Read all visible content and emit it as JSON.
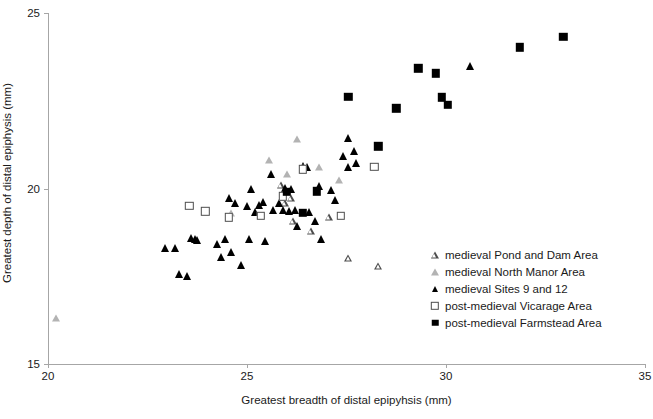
{
  "chart_data": {
    "type": "scatter",
    "title": "",
    "xlabel": "Greatest breadth of distal epipyhsis (mm)",
    "ylabel": "Greatest depth of distal epiphysis (mm)",
    "xlim": [
      20,
      35
    ],
    "ylim": [
      15,
      25
    ],
    "xticks": [
      20,
      25,
      30,
      35
    ],
    "yticks": [
      15,
      20,
      25
    ],
    "xtick_labels": [
      "20",
      "25",
      "30",
      "35"
    ],
    "ytick_labels": [
      "15",
      "20",
      "25"
    ],
    "grid": false,
    "legend_position": "center-right",
    "series": [
      {
        "name": "medieval Pond and Dam Area",
        "marker": "triangle-open",
        "color": "#4d4d4d",
        "points": [
          [
            25.85,
            20.1
          ],
          [
            25.95,
            19.78
          ],
          [
            26.1,
            20.14
          ],
          [
            26.15,
            19.68
          ],
          [
            26.6,
            19.6
          ],
          [
            27.05,
            20.18
          ],
          [
            27.55,
            19.22
          ],
          [
            28.3,
            19.18
          ]
        ]
      },
      {
        "name": "medieval North Manor Area",
        "marker": "triangle-grey",
        "color": "#b3b3b3",
        "points": [
          [
            20.2,
            16.32
          ],
          [
            24.6,
            19.3
          ],
          [
            25.55,
            20.8
          ],
          [
            26.0,
            20.42
          ],
          [
            26.25,
            21.42
          ],
          [
            26.8,
            20.6
          ],
          [
            27.3,
            20.25
          ]
        ]
      },
      {
        "name": "medieval Sites 9 and 12",
        "marker": "triangle-black",
        "color": "#000000",
        "points": [
          [
            22.95,
            18.3
          ],
          [
            23.2,
            18.3
          ],
          [
            23.3,
            17.55
          ],
          [
            23.5,
            17.52
          ],
          [
            23.6,
            18.6
          ],
          [
            23.7,
            18.55
          ],
          [
            23.75,
            18.52
          ],
          [
            24.25,
            18.42
          ],
          [
            24.35,
            18.05
          ],
          [
            24.45,
            18.55
          ],
          [
            24.55,
            19.72
          ],
          [
            24.6,
            18.2
          ],
          [
            24.7,
            19.58
          ],
          [
            24.85,
            17.82
          ],
          [
            25.0,
            19.5
          ],
          [
            25.05,
            18.55
          ],
          [
            25.1,
            19.98
          ],
          [
            25.2,
            19.32
          ],
          [
            25.3,
            19.52
          ],
          [
            25.4,
            19.62
          ],
          [
            25.45,
            18.5
          ],
          [
            25.6,
            20.42
          ],
          [
            25.65,
            19.38
          ],
          [
            25.8,
            19.6
          ],
          [
            25.9,
            19.4
          ],
          [
            25.95,
            20.02
          ],
          [
            26.05,
            19.35
          ],
          [
            26.1,
            19.98
          ],
          [
            26.2,
            19.4
          ],
          [
            26.25,
            18.92
          ],
          [
            26.4,
            20.65
          ],
          [
            26.5,
            20.6
          ],
          [
            26.55,
            19.32
          ],
          [
            26.7,
            19.08
          ],
          [
            26.8,
            20.08
          ],
          [
            26.85,
            18.55
          ],
          [
            27.1,
            19.95
          ],
          [
            27.2,
            19.68
          ],
          [
            27.4,
            20.92
          ],
          [
            27.55,
            20.6
          ],
          [
            27.55,
            21.45
          ],
          [
            27.7,
            21.08
          ],
          [
            27.75,
            20.72
          ],
          [
            30.6,
            23.5
          ]
        ]
      },
      {
        "name": "post-medieval Vicarage Area",
        "marker": "square-open",
        "color": "#4d4d4d",
        "points": [
          [
            23.55,
            19.5
          ],
          [
            23.95,
            19.35
          ],
          [
            24.55,
            19.18
          ],
          [
            25.35,
            19.22
          ],
          [
            25.9,
            19.78
          ],
          [
            26.4,
            20.55
          ],
          [
            27.35,
            19.22
          ],
          [
            28.2,
            20.62
          ]
        ]
      },
      {
        "name": "post-medieval Farmstead Area",
        "marker": "square-black",
        "color": "#000000",
        "points": [
          [
            26.0,
            19.9
          ],
          [
            26.4,
            19.3
          ],
          [
            26.75,
            19.92
          ],
          [
            27.55,
            22.62
          ],
          [
            28.3,
            21.2
          ],
          [
            28.75,
            22.28
          ],
          [
            29.3,
            23.42
          ],
          [
            29.75,
            23.28
          ],
          [
            29.9,
            22.6
          ],
          [
            30.05,
            22.38
          ],
          [
            31.85,
            24.02
          ],
          [
            32.95,
            24.32
          ]
        ]
      }
    ]
  },
  "legend": {
    "items": [
      {
        "label": "medieval Pond and Dam Area",
        "marker": "triangle-open"
      },
      {
        "label": "medieval North Manor Area",
        "marker": "triangle-grey"
      },
      {
        "label": "medieval Sites 9 and 12",
        "marker": "triangle-black"
      },
      {
        "label": "post-medieval Vicarage Area",
        "marker": "square-open"
      },
      {
        "label": "post-medieval Farmstead Area",
        "marker": "square-black"
      }
    ]
  },
  "colors": {
    "axis": "#a6a6a6",
    "text": "#1a1a1a",
    "grey_marker": "#b3b3b3",
    "outline_marker": "#4d4d4d",
    "black_marker": "#000000"
  }
}
